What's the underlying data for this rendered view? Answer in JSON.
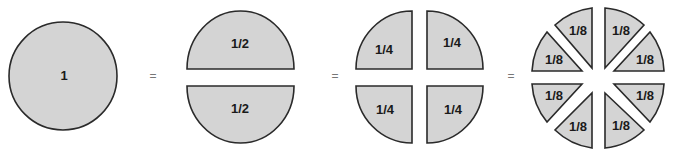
{
  "diagram": {
    "colors": {
      "fill": "#d4d4d4",
      "stroke": "#2a2a2a",
      "equals": "#777777"
    },
    "equals_sign": "=",
    "whole": {
      "label": "1"
    },
    "halves": [
      {
        "label": "1/2"
      },
      {
        "label": "1/2"
      }
    ],
    "quarters": [
      {
        "label": "1/4"
      },
      {
        "label": "1/4"
      },
      {
        "label": "1/4"
      },
      {
        "label": "1/4"
      }
    ],
    "eighths": [
      {
        "label": "1/8"
      },
      {
        "label": "1/8"
      },
      {
        "label": "1/8"
      },
      {
        "label": "1/8"
      },
      {
        "label": "1/8"
      },
      {
        "label": "1/8"
      },
      {
        "label": "1/8"
      },
      {
        "label": "1/8"
      }
    ]
  }
}
